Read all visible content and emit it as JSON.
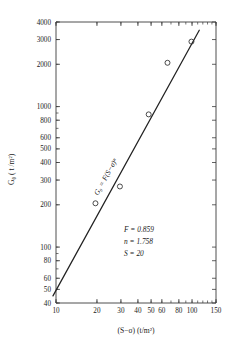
{
  "chart_data": {
    "type": "scatter",
    "title": "",
    "xlabel": "(S−σ)  (t/m²)",
    "ylabel": "G₀ ( t /m²)",
    "xscale": "log",
    "yscale": "log",
    "xlim": [
      10,
      150
    ],
    "ylim": [
      40,
      4000
    ],
    "grid": false,
    "legend": null,
    "x_tick_labels": [
      "10",
      "20",
      "30",
      "40",
      "50",
      "60",
      "80",
      "100",
      "150"
    ],
    "x_tick_values": [
      10,
      20,
      30,
      40,
      50,
      60,
      80,
      100,
      150
    ],
    "y_tick_labels": [
      "40",
      "50",
      "60",
      "80",
      "100",
      "200",
      "300",
      "400",
      "500",
      "600",
      "800",
      "1000",
      "2000",
      "3000",
      "4000"
    ],
    "y_tick_values": [
      40,
      50,
      60,
      80,
      100,
      200,
      300,
      400,
      500,
      600,
      800,
      1000,
      2000,
      3000,
      4000
    ],
    "points": [
      {
        "x": 19.5,
        "y": 205
      },
      {
        "x": 29.5,
        "y": 270
      },
      {
        "x": 48,
        "y": 880
      },
      {
        "x": 66,
        "y": 2050
      },
      {
        "x": 99,
        "y": 2900
      }
    ],
    "fit_line": {
      "equation_label": "G₀ = F(S−σ)ⁿ",
      "F": 0.859,
      "n": 1.758,
      "x_start": 9.5,
      "x_end": 113
    },
    "annotations": [
      "F = 0.859",
      "n = 1.758",
      "S = 20"
    ]
  },
  "figure": {
    "caption": ""
  }
}
